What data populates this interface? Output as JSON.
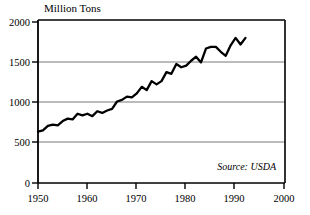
{
  "chart_data": {
    "type": "line",
    "title": "Million Tons",
    "xlabel": "",
    "ylabel": "Million Tons",
    "xlim": [
      1950,
      2000
    ],
    "ylim": [
      0,
      2000
    ],
    "grid": true,
    "legend_position": "none",
    "annotation": "Source: USDA",
    "x_ticks": [
      "1950",
      "1960",
      "1970",
      "1980",
      "1990",
      "2000"
    ],
    "y_ticks": [
      "0",
      "500",
      "1000",
      "1500",
      "2000"
    ],
    "series": [
      {
        "name": "World Grain Production",
        "x": [
          1950,
          1951,
          1952,
          1953,
          1954,
          1955,
          1956,
          1957,
          1958,
          1959,
          1960,
          1961,
          1962,
          1963,
          1964,
          1965,
          1966,
          1967,
          1968,
          1969,
          1970,
          1971,
          1972,
          1973,
          1974,
          1975,
          1976,
          1977,
          1978,
          1979,
          1980,
          1981,
          1982,
          1983,
          1984,
          1985,
          1986,
          1987,
          1988,
          1989,
          1990,
          1991,
          1992
        ],
        "values": [
          631,
          645,
          700,
          717,
          708,
          760,
          790,
          780,
          850,
          830,
          850,
          820,
          880,
          860,
          890,
          910,
          1000,
          1020,
          1060,
          1050,
          1100,
          1180,
          1140,
          1250,
          1210,
          1250,
          1360,
          1340,
          1460,
          1420,
          1440,
          1500,
          1550,
          1480,
          1650,
          1670,
          1670,
          1610,
          1560,
          1690,
          1780,
          1700,
          1780
        ]
      }
    ]
  },
  "axes": {
    "y_axis_label": "Million Tons",
    "source_text": "Source: USDA"
  }
}
